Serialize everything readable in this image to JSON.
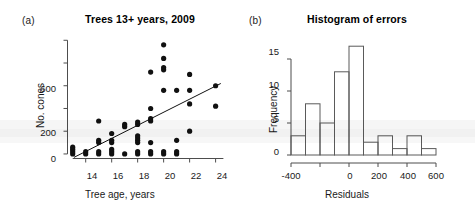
{
  "figure": {
    "background": "#ffffff",
    "point_color": "#111111",
    "bar_stroke": "#5a5a5a",
    "axis_color": "#4d4d4d"
  },
  "panels": [
    {
      "letter": "(a)",
      "title": "Trees 13+ years, 2009"
    },
    {
      "letter": "(b)",
      "title": "Histogram of errors"
    }
  ],
  "chart_data": [
    {
      "type": "scatter",
      "title": "Trees 13+ years, 2009",
      "panel": "(a)",
      "xlabel": "Tree age, years",
      "ylabel": "No. cones",
      "xlim": [
        12.6,
        24.8
      ],
      "ylim": [
        -40,
        1020
      ],
      "xticks": [
        14,
        16,
        18,
        20,
        22,
        24
      ],
      "xtick_labels": [
        "14",
        "16",
        "18",
        "20",
        "22",
        "24"
      ],
      "yticks": [
        0,
        200,
        400,
        600,
        800,
        1000
      ],
      "ytick_labels": [
        "0",
        "200",
        "",
        "600",
        "",
        ""
      ],
      "grid": false,
      "legend": false,
      "points": [
        [
          13,
          0
        ],
        [
          13,
          20
        ],
        [
          13,
          40
        ],
        [
          13,
          60
        ],
        [
          14,
          0
        ],
        [
          14,
          20
        ],
        [
          15,
          0
        ],
        [
          15,
          20
        ],
        [
          15,
          100
        ],
        [
          15,
          120
        ],
        [
          15,
          290
        ],
        [
          16,
          0
        ],
        [
          16,
          20
        ],
        [
          16,
          40
        ],
        [
          16,
          100
        ],
        [
          16,
          120
        ],
        [
          16,
          180
        ],
        [
          17,
          0
        ],
        [
          17,
          240
        ],
        [
          17,
          260
        ],
        [
          18,
          0
        ],
        [
          18,
          20
        ],
        [
          18,
          100
        ],
        [
          18,
          120
        ],
        [
          18,
          140
        ],
        [
          18,
          160
        ],
        [
          18,
          260
        ],
        [
          18,
          280
        ],
        [
          19,
          0
        ],
        [
          19,
          20
        ],
        [
          19,
          100
        ],
        [
          19,
          290
        ],
        [
          19,
          310
        ],
        [
          19,
          400
        ],
        [
          19,
          720
        ],
        [
          20,
          0
        ],
        [
          20,
          20
        ],
        [
          20,
          560
        ],
        [
          20,
          740
        ],
        [
          20,
          760
        ],
        [
          20,
          840
        ],
        [
          20,
          960
        ],
        [
          21,
          0
        ],
        [
          21,
          20
        ],
        [
          21,
          120
        ],
        [
          21,
          560
        ],
        [
          22,
          200
        ],
        [
          22,
          440
        ],
        [
          22,
          560
        ],
        [
          22,
          700
        ],
        [
          24,
          420
        ],
        [
          24,
          600
        ]
      ],
      "fit_line": {
        "x": [
          13.1,
          24.4
        ],
        "y": [
          -30,
          620
        ],
        "description": "least-squares regression line"
      }
    },
    {
      "type": "bar",
      "subtype": "histogram",
      "title": "Histogram of errors",
      "panel": "(b)",
      "xlabel": "Residuals",
      "ylabel": "Frequency",
      "xlim": [
        -400,
        600
      ],
      "ylim": [
        0,
        17.5
      ],
      "xticks": [
        -400,
        -200,
        0,
        200,
        400,
        600
      ],
      "xtick_labels": [
        "-400",
        "",
        "0",
        "200",
        "400",
        "600"
      ],
      "yticks": [
        0,
        5,
        10,
        15
      ],
      "ytick_labels": [
        "0",
        "5",
        "10",
        "15"
      ],
      "grid": false,
      "legend": false,
      "bin_width": 100,
      "bin_edges": [
        -400,
        -300,
        -200,
        -100,
        0,
        100,
        200,
        300,
        400,
        500,
        600
      ],
      "categories": [
        "-400 to -300",
        "-300 to -200",
        "-200 to -100",
        "-100 to 0",
        "0 to 100",
        "100 to 200",
        "200 to 300",
        "300 to 400",
        "400 to 500",
        "500 to 600"
      ],
      "values": [
        3,
        8,
        5,
        13,
        17,
        2,
        3,
        1,
        3,
        1
      ]
    }
  ]
}
